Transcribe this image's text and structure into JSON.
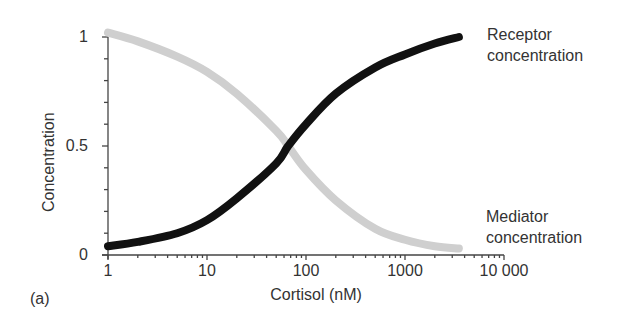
{
  "panel_label": "(a)",
  "chart_data": {
    "type": "line",
    "title": "",
    "xlabel": "Cortisol (nM)",
    "ylabel": "Concentration",
    "xscale": "log",
    "xlim": [
      1,
      10000
    ],
    "ylim": [
      0,
      1
    ],
    "x_ticks": [
      "1",
      "10",
      "100",
      "1000",
      "10 000"
    ],
    "y_ticks": [
      "0",
      "0.5",
      "1"
    ],
    "grid": false,
    "legend_position": "inline-right",
    "x": [
      1,
      2,
      5,
      10,
      20,
      50,
      66,
      100,
      200,
      500,
      1000,
      2000,
      3500
    ],
    "series": [
      {
        "name": "Receptor concentration",
        "color": "#111111",
        "values": [
          0.04,
          0.06,
          0.1,
          0.16,
          0.26,
          0.42,
          0.5,
          0.6,
          0.74,
          0.86,
          0.92,
          0.97,
          1.0
        ]
      },
      {
        "name": "Mediator concentration",
        "color": "#cccccc",
        "values": [
          1.02,
          0.98,
          0.91,
          0.84,
          0.74,
          0.57,
          0.5,
          0.39,
          0.25,
          0.12,
          0.07,
          0.04,
          0.03
        ]
      }
    ],
    "annotations": [
      {
        "text": "Receptor concentration",
        "near": "upper-right end of black curve"
      },
      {
        "text": "Mediator concentration",
        "near": "lower-right end of grey curve"
      }
    ]
  },
  "legend": {
    "receptor_line1": "Receptor",
    "receptor_line2": "concentration",
    "mediator_line1": "Mediator",
    "mediator_line2": "concentration"
  }
}
